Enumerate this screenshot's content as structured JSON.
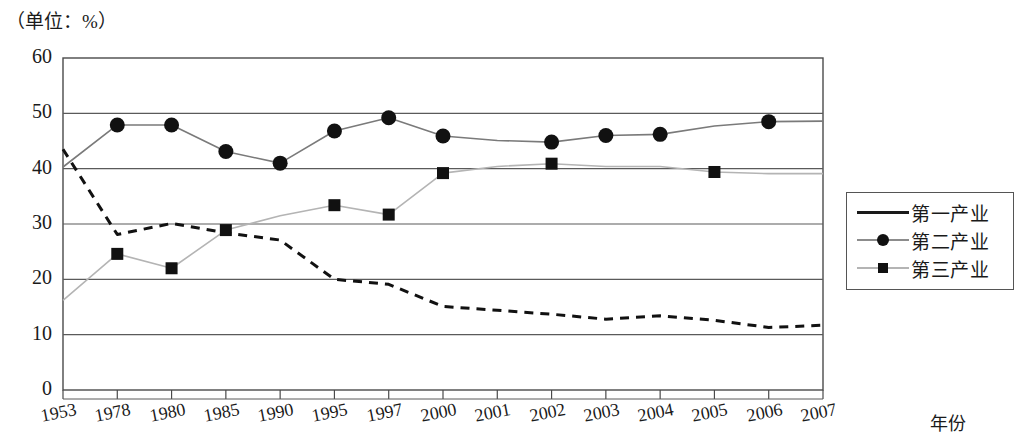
{
  "axis_unit_note": "（单位：%）",
  "legend": {
    "items": [
      {
        "label": "第一产业",
        "marker": "none",
        "style": "dashed-solid-black"
      },
      {
        "label": "第二产业",
        "marker": "circle",
        "style": "solid-grey"
      },
      {
        "label": "第三产业",
        "marker": "square",
        "style": "solid-lightgrey"
      }
    ]
  },
  "chart_data": {
    "type": "line",
    "title": "",
    "subtitle": "（单位：%）",
    "xlabel": "年份",
    "ylabel": "",
    "ylim": [
      0,
      60
    ],
    "ytick_step": 10,
    "yticks": [
      0,
      10,
      20,
      30,
      40,
      50,
      60
    ],
    "grid": true,
    "legend_position": "right",
    "categories": [
      "1953",
      "1978",
      "1980",
      "1985",
      "1990",
      "1995",
      "1997",
      "2000",
      "2001",
      "2002",
      "2003",
      "2004",
      "2005",
      "2006",
      "2007"
    ],
    "series": [
      {
        "name": "第一产业",
        "marker": "none",
        "line": "dashed",
        "color": "#111111",
        "values": [
          43.5,
          28.1,
          30.1,
          28.4,
          27.1,
          20.0,
          19.1,
          15.1,
          14.4,
          13.7,
          12.8,
          13.4,
          12.6,
          11.3,
          11.7
        ]
      },
      {
        "name": "第二产业",
        "marker": "circle",
        "line": "solid",
        "color": "#7a7a7a",
        "values": [
          40.3,
          47.9,
          47.9,
          43.1,
          41.0,
          46.8,
          49.2,
          45.9,
          45.1,
          44.8,
          46.0,
          46.2,
          47.7,
          48.5,
          48.6
        ]
      },
      {
        "name": "第三产业",
        "marker": "square",
        "line": "solid",
        "color": "#b4b4b4",
        "values": [
          16.2,
          24.6,
          22.0,
          28.9,
          31.5,
          33.4,
          31.7,
          39.2,
          40.4,
          40.9,
          40.4,
          40.4,
          39.4,
          39.1,
          39.1
        ]
      }
    ],
    "marker_years": {
      "第二产业": [
        "1978",
        "1980",
        "1985",
        "1990",
        "1995",
        "1997",
        "2000",
        "2002",
        "2003",
        "2004",
        "2006"
      ],
      "第三产业": [
        "1978",
        "1980",
        "1985",
        "1995",
        "1997",
        "2000",
        "2002",
        "2005"
      ]
    }
  }
}
